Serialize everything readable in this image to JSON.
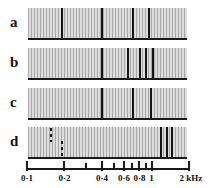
{
  "figure": {
    "title": "",
    "axis_unit": "kHz",
    "panels": [
      {
        "label": "a"
      },
      {
        "label": "b"
      },
      {
        "label": "c"
      },
      {
        "label": "d"
      }
    ],
    "axis_ticks": [
      {
        "value": 0.1,
        "label": "0·1",
        "size": "major"
      },
      {
        "value": 0.2,
        "label": "0·2",
        "size": "major"
      },
      {
        "value": 0.3,
        "label": "",
        "size": "small"
      },
      {
        "value": 0.4,
        "label": "0·4",
        "size": "major"
      },
      {
        "value": 0.5,
        "label": "",
        "size": "small"
      },
      {
        "value": 0.6,
        "label": "0·6",
        "size": "major"
      },
      {
        "value": 0.7,
        "label": "",
        "size": "small"
      },
      {
        "value": 0.8,
        "label": "0·8",
        "size": "major"
      },
      {
        "value": 0.9,
        "label": "",
        "size": "small"
      },
      {
        "value": 1.0,
        "label": "1",
        "size": "major"
      },
      {
        "value": 2.0,
        "label": "2 kHz",
        "size": "major"
      }
    ]
  },
  "chart_data": {
    "type": "line",
    "title": "",
    "xlabel": "kHz",
    "ylabel": "",
    "xscale": "log",
    "xlim": [
      0.1,
      2.0
    ],
    "grid": false,
    "legend": "none",
    "colors": {
      "background": "#ffffff",
      "hatch_dark": "#a8a8a8",
      "hatch_light": "#dcdcdc",
      "marker": "#141414",
      "baseline": "#1a1a1a"
    },
    "series": [
      {
        "name": "a",
        "markers": [
          {
            "freq": 0.19,
            "style": "solid"
          },
          {
            "freq": 0.4,
            "style": "solid"
          },
          {
            "freq": 0.72,
            "style": "solid"
          },
          {
            "freq": 0.98,
            "style": "solid"
          }
        ]
      },
      {
        "name": "b",
        "markers": [
          {
            "freq": 0.4,
            "style": "solid"
          },
          {
            "freq": 0.66,
            "style": "solid"
          },
          {
            "freq": 0.82,
            "style": "solid"
          },
          {
            "freq": 0.93,
            "style": "solid"
          },
          {
            "freq": 1.06,
            "style": "solid"
          }
        ]
      },
      {
        "name": "c",
        "markers": [
          {
            "freq": 0.4,
            "style": "solid"
          },
          {
            "freq": 0.72,
            "style": "solid"
          },
          {
            "freq": 1.02,
            "style": "solid"
          }
        ]
      },
      {
        "name": "d",
        "markers": [
          {
            "freq": 0.153,
            "style": "dashed",
            "extent": "upper"
          },
          {
            "freq": 0.188,
            "style": "dashed",
            "extent": "lower"
          },
          {
            "freq": 1.22,
            "style": "solid"
          },
          {
            "freq": 1.38,
            "style": "solid"
          },
          {
            "freq": 1.52,
            "style": "solid"
          }
        ]
      }
    ]
  }
}
